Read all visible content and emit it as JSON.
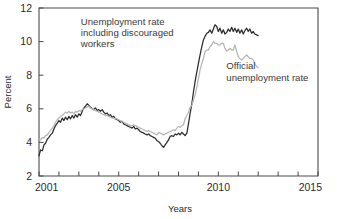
{
  "chart_data": {
    "type": "line",
    "title": "",
    "xlabel": "Years",
    "ylabel": "Percent",
    "xlim": [
      2001,
      2015
    ],
    "ylim": [
      2,
      12
    ],
    "grid": false,
    "legend_position": "inline-annotations",
    "y_ticks": [
      2,
      4,
      6,
      8,
      10,
      12
    ],
    "y_tick_labels": [
      "2",
      "4",
      "6",
      "8",
      "10",
      "12"
    ],
    "x_ticks": [
      2001,
      2002,
      2003,
      2004,
      2005,
      2006,
      2007,
      2008,
      2009,
      2010,
      2011,
      2012,
      2013,
      2014,
      2015
    ],
    "x_tick_labels": [
      {
        "value": 2001,
        "label": "2001"
      },
      {
        "value": 2005,
        "label": "2005"
      },
      {
        "value": 2010,
        "label": "2010"
      },
      {
        "value": 2015,
        "label": "2015"
      }
    ],
    "annotations": [
      {
        "name": "u6-annotation",
        "lines": [
          "Unemployment rate",
          "including discouraged",
          "workers"
        ],
        "x": 2003.1,
        "y": 11.0
      },
      {
        "name": "official-annotation",
        "lines": [
          "Official",
          "unemployment rate"
        ],
        "x": 2010.4,
        "y": 8.35
      }
    ],
    "series": [
      {
        "name": "Unemployment rate including discouraged workers",
        "short_name": "u6",
        "color": "#2b2b2b",
        "width": 1.25,
        "x": [
          2001.0,
          2001.08,
          2001.17,
          2001.25,
          2001.33,
          2001.42,
          2001.5,
          2001.58,
          2001.67,
          2001.75,
          2001.83,
          2001.92,
          2002.0,
          2002.08,
          2002.17,
          2002.25,
          2002.33,
          2002.42,
          2002.5,
          2002.58,
          2002.67,
          2002.75,
          2002.83,
          2002.92,
          2003.0,
          2003.08,
          2003.17,
          2003.25,
          2003.33,
          2003.42,
          2003.5,
          2003.58,
          2003.67,
          2003.75,
          2003.83,
          2003.92,
          2004.0,
          2004.08,
          2004.17,
          2004.25,
          2004.33,
          2004.42,
          2004.5,
          2004.58,
          2004.67,
          2004.75,
          2004.83,
          2004.92,
          2005.0,
          2005.08,
          2005.17,
          2005.25,
          2005.33,
          2005.42,
          2005.5,
          2005.58,
          2005.67,
          2005.75,
          2005.83,
          2005.92,
          2006.0,
          2006.08,
          2006.17,
          2006.25,
          2006.33,
          2006.42,
          2006.5,
          2006.58,
          2006.67,
          2006.75,
          2006.83,
          2006.92,
          2007.0,
          2007.08,
          2007.17,
          2007.25,
          2007.33,
          2007.42,
          2007.5,
          2007.58,
          2007.67,
          2007.75,
          2007.83,
          2007.92,
          2008.0,
          2008.08,
          2008.17,
          2008.25,
          2008.33,
          2008.42,
          2008.5,
          2008.58,
          2008.67,
          2008.75,
          2008.83,
          2008.92,
          2009.0,
          2009.08,
          2009.17,
          2009.25,
          2009.33,
          2009.42,
          2009.5,
          2009.58,
          2009.67,
          2009.75,
          2009.83,
          2009.92,
          2010.0,
          2010.08,
          2010.17,
          2010.25,
          2010.33,
          2010.42,
          2010.5,
          2010.58,
          2010.67,
          2010.75,
          2010.83,
          2010.92,
          2011.0,
          2011.08,
          2011.17,
          2011.25,
          2011.33,
          2011.42,
          2011.5,
          2011.58,
          2011.67,
          2011.75,
          2011.83,
          2011.92,
          2012.0
        ],
        "values": [
          3.2,
          3.55,
          3.5,
          3.85,
          3.95,
          4.2,
          4.3,
          4.45,
          4.55,
          4.8,
          5.0,
          5.15,
          5.3,
          5.2,
          5.45,
          5.3,
          5.5,
          5.35,
          5.55,
          5.4,
          5.6,
          5.45,
          5.65,
          5.5,
          5.7,
          5.6,
          5.85,
          6.05,
          6.15,
          6.3,
          6.2,
          6.1,
          6.0,
          5.95,
          6.05,
          5.9,
          5.95,
          5.85,
          5.95,
          5.8,
          5.7,
          5.75,
          5.6,
          5.65,
          5.5,
          5.55,
          5.4,
          5.35,
          5.3,
          5.2,
          5.25,
          5.1,
          5.05,
          5.0,
          4.95,
          4.9,
          4.85,
          4.95,
          4.8,
          4.85,
          4.75,
          4.65,
          4.6,
          4.55,
          4.5,
          4.45,
          4.5,
          4.4,
          4.35,
          4.3,
          4.25,
          4.1,
          4.05,
          3.95,
          3.8,
          3.7,
          3.85,
          4.0,
          4.15,
          4.35,
          4.4,
          4.35,
          4.5,
          4.45,
          4.55,
          4.45,
          4.6,
          4.5,
          4.4,
          4.55,
          5.1,
          5.7,
          6.3,
          7.0,
          7.6,
          8.2,
          8.7,
          9.2,
          9.7,
          10.1,
          10.3,
          10.5,
          10.55,
          10.7,
          10.5,
          10.75,
          11.0,
          10.9,
          10.6,
          10.8,
          10.5,
          10.7,
          10.45,
          10.55,
          10.75,
          10.6,
          10.85,
          10.6,
          10.8,
          10.55,
          10.75,
          10.5,
          10.7,
          10.45,
          10.65,
          10.8,
          10.6,
          10.75,
          10.5,
          10.6,
          10.45,
          10.4,
          10.35
        ]
      },
      {
        "name": "Official unemployment rate",
        "short_name": "u3",
        "color": "#b5b5b5",
        "width": 1.25,
        "x": [
          2001.0,
          2001.08,
          2001.17,
          2001.25,
          2001.33,
          2001.42,
          2001.5,
          2001.58,
          2001.67,
          2001.75,
          2001.83,
          2001.92,
          2002.0,
          2002.08,
          2002.17,
          2002.25,
          2002.33,
          2002.42,
          2002.5,
          2002.58,
          2002.67,
          2002.75,
          2002.83,
          2002.92,
          2003.0,
          2003.08,
          2003.17,
          2003.25,
          2003.33,
          2003.42,
          2003.5,
          2003.58,
          2003.67,
          2003.75,
          2003.83,
          2003.92,
          2004.0,
          2004.08,
          2004.17,
          2004.25,
          2004.33,
          2004.42,
          2004.5,
          2004.58,
          2004.67,
          2004.75,
          2004.83,
          2004.92,
          2005.0,
          2005.08,
          2005.17,
          2005.25,
          2005.33,
          2005.42,
          2005.5,
          2005.58,
          2005.67,
          2005.75,
          2005.83,
          2005.92,
          2006.0,
          2006.08,
          2006.17,
          2006.25,
          2006.33,
          2006.42,
          2006.5,
          2006.58,
          2006.67,
          2006.75,
          2006.83,
          2006.92,
          2007.0,
          2007.08,
          2007.17,
          2007.25,
          2007.33,
          2007.42,
          2007.5,
          2007.58,
          2007.67,
          2007.75,
          2007.83,
          2007.92,
          2008.0,
          2008.08,
          2008.17,
          2008.25,
          2008.33,
          2008.42,
          2008.5,
          2008.58,
          2008.67,
          2008.75,
          2008.83,
          2008.92,
          2009.0,
          2009.08,
          2009.17,
          2009.25,
          2009.33,
          2009.42,
          2009.5,
          2009.58,
          2009.67,
          2009.75,
          2009.83,
          2009.92,
          2010.0,
          2010.08,
          2010.17,
          2010.25,
          2010.33,
          2010.42,
          2010.5,
          2010.58,
          2010.67,
          2010.75,
          2010.83,
          2010.92,
          2011.0,
          2011.08,
          2011.17,
          2011.25,
          2011.33,
          2011.42,
          2011.5,
          2011.58,
          2011.67,
          2011.75,
          2011.83,
          2011.92,
          2012.0
        ],
        "values": [
          4.2,
          4.15,
          4.3,
          4.25,
          4.4,
          4.45,
          4.6,
          4.7,
          4.85,
          5.0,
          5.2,
          5.35,
          5.45,
          5.55,
          5.6,
          5.7,
          5.8,
          5.75,
          5.85,
          5.75,
          5.8,
          5.7,
          5.85,
          5.8,
          5.9,
          5.85,
          5.95,
          6.0,
          6.05,
          6.1,
          6.15,
          6.05,
          6.0,
          5.95,
          5.9,
          5.85,
          5.8,
          5.75,
          5.7,
          5.65,
          5.6,
          5.6,
          5.55,
          5.5,
          5.45,
          5.45,
          5.4,
          5.4,
          5.35,
          5.3,
          5.25,
          5.2,
          5.15,
          5.1,
          5.05,
          5.0,
          5.0,
          5.05,
          5.0,
          4.95,
          4.9,
          4.85,
          4.8,
          4.75,
          4.7,
          4.65,
          4.7,
          4.65,
          4.6,
          4.55,
          4.5,
          4.45,
          4.6,
          4.55,
          4.5,
          4.45,
          4.5,
          4.55,
          4.6,
          4.65,
          4.7,
          4.75,
          4.7,
          4.85,
          4.95,
          4.9,
          5.0,
          5.05,
          5.4,
          5.6,
          5.8,
          6.1,
          6.2,
          6.55,
          6.8,
          7.3,
          7.8,
          8.3,
          8.7,
          9.0,
          9.4,
          9.5,
          9.5,
          9.7,
          9.8,
          10.0,
          9.9,
          9.9,
          9.8,
          9.8,
          9.9,
          9.9,
          9.6,
          9.45,
          9.5,
          9.6,
          9.5,
          9.5,
          9.8,
          9.4,
          9.1,
          9.0,
          8.9,
          9.0,
          9.1,
          9.2,
          9.1,
          9.0,
          9.0,
          8.9,
          8.7,
          8.5,
          8.45
        ]
      }
    ]
  }
}
